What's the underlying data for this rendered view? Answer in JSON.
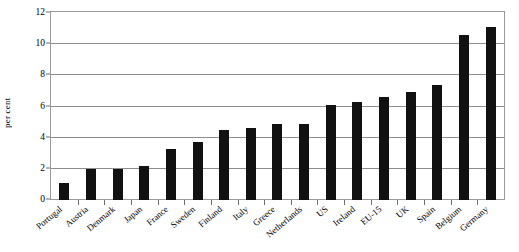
{
  "chart_data": {
    "type": "bar",
    "title": "",
    "xlabel": "",
    "ylabel": "per cent",
    "ylim": [
      0,
      12
    ],
    "ytick_values": [
      0,
      2,
      4,
      6,
      8,
      10,
      12
    ],
    "ytick_labels": [
      "0",
      "2",
      "4",
      "6",
      "8",
      "10",
      "12"
    ],
    "grid": true,
    "legend": "none",
    "bar_color": "#111111",
    "categories": [
      "Portugal",
      "Austria",
      "Denmark",
      "Japan",
      "France",
      "Sweden",
      "Finland",
      "Italy",
      "Greece",
      "Netherlands",
      "US",
      "Ireland",
      "EU-15",
      "UK",
      "Spain",
      "Belgium",
      "Germany"
    ],
    "values": [
      1.1,
      2.0,
      2.0,
      2.2,
      3.3,
      3.7,
      4.5,
      4.6,
      4.9,
      4.9,
      6.1,
      6.3,
      6.6,
      6.9,
      7.4,
      10.6,
      11.1
    ],
    "series": [
      {
        "name": "per cent",
        "values": [
          1.1,
          2.0,
          2.0,
          2.2,
          3.3,
          3.7,
          4.5,
          4.6,
          4.9,
          4.9,
          6.1,
          6.3,
          6.6,
          6.9,
          7.4,
          10.6,
          11.1
        ]
      }
    ]
  }
}
